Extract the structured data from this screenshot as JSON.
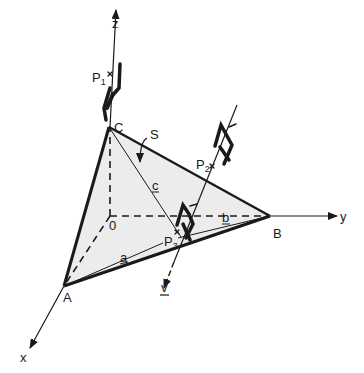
{
  "diagram": {
    "type": "3d-coordinate-geometry",
    "axes": {
      "x": {
        "label": "x"
      },
      "y": {
        "label": "y"
      },
      "z": {
        "label": "z"
      },
      "origin": {
        "label": "0"
      }
    },
    "points": {
      "A": {
        "label": "A"
      },
      "B": {
        "label": "B"
      },
      "C": {
        "label": "C"
      }
    },
    "plane": {
      "label": "S",
      "fill": "#ececec"
    },
    "segments": {
      "a": {
        "label": "a"
      },
      "b": {
        "label": "b"
      },
      "c": {
        "label": "c"
      }
    },
    "vector": {
      "label": "v"
    },
    "observers": [
      {
        "label": "P",
        "sub": "1"
      },
      {
        "label": "P",
        "sub": "2"
      },
      {
        "label": "P",
        "sub": "3"
      }
    ],
    "colors": {
      "line": "#1a1a1a",
      "plane": "#ececec",
      "background": "#ffffff"
    }
  }
}
